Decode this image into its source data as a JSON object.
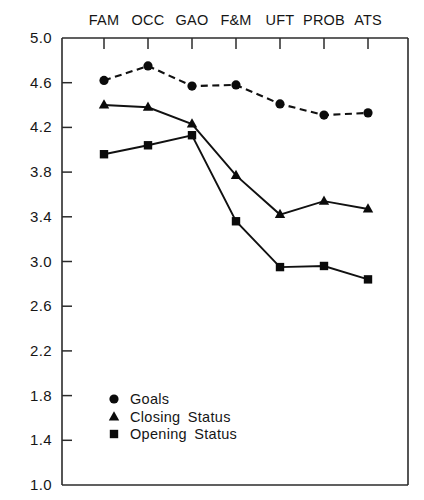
{
  "chart_data": {
    "type": "line",
    "title": "",
    "subtitle": "",
    "xlabel": "",
    "ylabel": "",
    "categories": [
      "FAM",
      "OCC",
      "GAO",
      "F&M",
      "UFT",
      "PROB",
      "ATS"
    ],
    "ylim": [
      1.0,
      5.0
    ],
    "yticks": [
      5.0,
      4.6,
      4.2,
      3.8,
      3.4,
      3.0,
      2.6,
      2.2,
      1.8,
      1.4,
      1.0
    ],
    "ytick_labels": [
      "5.0",
      "4.6",
      "4.2",
      "3.8",
      "3.4",
      "3.0",
      "2.6",
      "2.2",
      "1.8",
      "1.4",
      "1.0"
    ],
    "grid": false,
    "xaxis_position": "top",
    "legend_position": "inside-lower-left",
    "series": [
      {
        "name": "Goals",
        "marker": "circle",
        "linestyle": "dashed",
        "color": "#0b0b0b",
        "values": [
          4.62,
          4.75,
          4.57,
          4.58,
          4.41,
          4.31,
          4.33
        ]
      },
      {
        "name": "Closing Status",
        "marker": "triangle",
        "linestyle": "solid",
        "color": "#0b0b0b",
        "values": [
          4.4,
          4.38,
          4.23,
          3.77,
          3.42,
          3.54,
          3.47
        ]
      },
      {
        "name": "Opening Status",
        "marker": "square",
        "linestyle": "solid",
        "color": "#0b0b0b",
        "values": [
          3.96,
          4.04,
          4.13,
          3.36,
          2.95,
          2.96,
          2.84
        ]
      }
    ]
  },
  "legend": {
    "entries": [
      {
        "label": "Goals",
        "marker": "circle"
      },
      {
        "label": "Closing  Status",
        "marker": "triangle"
      },
      {
        "label": "Opening  Status",
        "marker": "square"
      }
    ]
  },
  "plot_geometry": {
    "left": 62,
    "right": 408,
    "top": 38,
    "bottom": 485,
    "category_x": [
      104,
      148,
      192,
      236,
      280,
      324,
      368
    ],
    "legend_marker_x": 114,
    "legend_rows_y": [
      399,
      417,
      434
    ]
  }
}
